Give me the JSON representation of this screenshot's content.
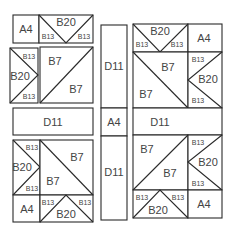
{
  "diagram": {
    "colors": {
      "line": "#2a2a2a",
      "text": "#444444",
      "background": "#ffffff"
    },
    "labels": {
      "a4": "A4",
      "b7": "B7",
      "b13": "B13",
      "b20": "B20",
      "d11": "D11"
    },
    "blocks": {
      "top_left": {
        "top_row": [
          "A4",
          "B13",
          "B20",
          "B13"
        ],
        "side_column": [
          "B13",
          "B20",
          "B13"
        ],
        "square": [
          "B7",
          "B7"
        ]
      },
      "top_right": {
        "top_row": [
          "B13",
          "B20",
          "B13",
          "A4"
        ],
        "square": [
          "B7",
          "B7"
        ],
        "side_column": [
          "B13",
          "B20",
          "B13"
        ]
      },
      "middle_left_bar": "D11",
      "middle_right_bar": "D11",
      "center_column": [
        "D11",
        "A4",
        "D11"
      ],
      "bottom_left": {
        "side_column": [
          "B13",
          "B20",
          "B13"
        ],
        "square": [
          "B7",
          "B7"
        ],
        "bottom_row": [
          "A4",
          "B13",
          "B20",
          "B13"
        ]
      },
      "bottom_right": {
        "square": [
          "B7",
          "B7"
        ],
        "side_column": [
          "B13",
          "B20",
          "B13"
        ],
        "bottom_row": [
          "B13",
          "B20",
          "B13",
          "A4"
        ]
      }
    }
  }
}
